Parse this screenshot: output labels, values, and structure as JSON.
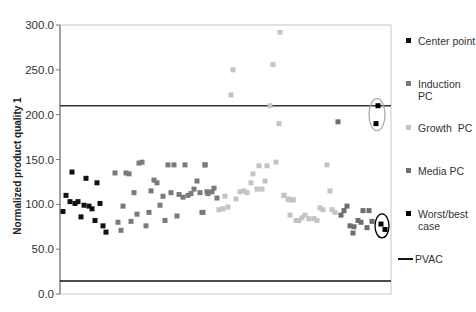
{
  "chart_data": {
    "type": "scatter",
    "title": "",
    "xlabel": "",
    "ylabel": "Normalized product quality 1",
    "ylim": [
      0,
      300
    ],
    "yticks": [
      "0.0",
      "50.0",
      "100.0",
      "150.0",
      "200.0",
      "250.0",
      "300.0"
    ],
    "grid": false,
    "legend_position": "right",
    "reference_lines": [
      {
        "name": "PVAC",
        "y": 210,
        "color": "#333333"
      },
      {
        "name": "PVAC",
        "y": 14.5,
        "color": "#111111"
      }
    ],
    "annotations": [
      {
        "shape": "ellipse",
        "cx": 317,
        "cy": 200,
        "rx": 8,
        "ry": 16,
        "color": "#aaaaaa"
      },
      {
        "shape": "ellipse",
        "cx": 322,
        "cy": 76,
        "rx": 7,
        "ry": 12,
        "color": "#000000"
      }
    ],
    "series": [
      {
        "name": "Center point",
        "color": "#111111",
        "points": [
          [
            3,
            92
          ],
          [
            6,
            110
          ],
          [
            10,
            103
          ],
          [
            12,
            136
          ],
          [
            15,
            101
          ],
          [
            18,
            103
          ],
          [
            21,
            86
          ],
          [
            24,
            99
          ],
          [
            26,
            129
          ],
          [
            29,
            98
          ],
          [
            32,
            95
          ],
          [
            35,
            82
          ],
          [
            37,
            124
          ],
          [
            40,
            101
          ],
          [
            43,
            76
          ],
          [
            46,
            69
          ]
        ]
      },
      {
        "name": "Induction PC",
        "color": "#7a7a7a",
        "points": [
          [
            55,
            135
          ],
          [
            66,
            135
          ],
          [
            69,
            134
          ],
          [
            79,
            146
          ],
          [
            82,
            147
          ],
          [
            108,
            144
          ],
          [
            114,
            144
          ],
          [
            125,
            144
          ],
          [
            145,
            144
          ],
          [
            145,
            144
          ],
          [
            94,
            127
          ],
          [
            97,
            124
          ],
          [
            137,
            126
          ],
          [
            74,
            113
          ],
          [
            91,
            115
          ],
          [
            103,
            109
          ],
          [
            111,
            113
          ],
          [
            119,
            111
          ],
          [
            123,
            108
          ],
          [
            128,
            110
          ],
          [
            131,
            112
          ],
          [
            134,
            117
          ],
          [
            140,
            113
          ],
          [
            147,
            114
          ],
          [
            63,
            98
          ],
          [
            100,
            99
          ],
          [
            77,
            89
          ],
          [
            89,
            91
          ],
          [
            117,
            87
          ],
          [
            143,
            91
          ],
          [
            105,
            82
          ],
          [
            58,
            80
          ],
          [
            71,
            81
          ],
          [
            86,
            76
          ],
          [
            61,
            71
          ],
          [
            148,
            112
          ],
          [
            152,
            114
          ],
          [
            154,
            118
          ],
          [
            157,
            107
          ],
          [
            142,
            91
          ]
        ]
      },
      {
        "name": "Growth PC",
        "color": "#c4c4c4",
        "points": [
          [
            220,
            292
          ],
          [
            173,
            250
          ],
          [
            213,
            256
          ],
          [
            171,
            222
          ],
          [
            210,
            210
          ],
          [
            219,
            190
          ],
          [
            199,
            143
          ],
          [
            207,
            143
          ],
          [
            216,
            147
          ],
          [
            193,
            134
          ],
          [
            191,
            124
          ],
          [
            205,
            126
          ],
          [
            197,
            117
          ],
          [
            202,
            117
          ],
          [
            180,
            114
          ],
          [
            184,
            115
          ],
          [
            187,
            113
          ],
          [
            165,
            109
          ],
          [
            176,
            106
          ],
          [
            224,
            110
          ],
          [
            228,
            106
          ],
          [
            233,
            105
          ],
          [
            159,
            94
          ],
          [
            163,
            95
          ],
          [
            168,
            97
          ],
          [
            267,
            144
          ],
          [
            270,
            115
          ],
          [
            224,
            110
          ],
          [
            229,
            105
          ],
          [
            233,
            105
          ],
          [
            230,
            88
          ],
          [
            236,
            82
          ],
          [
            239,
            82
          ],
          [
            242,
            85
          ],
          [
            245,
            88
          ],
          [
            249,
            84
          ],
          [
            254,
            84
          ],
          [
            257,
            82
          ],
          [
            260,
            96
          ],
          [
            263,
            94
          ],
          [
            272,
            94
          ],
          [
            275,
            91
          ]
        ]
      },
      {
        "name": "Media PC",
        "color": "#6e6e6e",
        "points": [
          [
            278,
            192
          ],
          [
            287,
            98
          ],
          [
            284,
            93
          ],
          [
            281,
            88
          ],
          [
            303,
            93
          ],
          [
            309,
            93
          ],
          [
            298,
            82
          ],
          [
            301,
            80
          ],
          [
            312,
            81
          ],
          [
            290,
            76
          ],
          [
            294,
            75
          ],
          [
            307,
            74
          ],
          [
            293,
            68
          ]
        ]
      },
      {
        "name": "Worst/best case",
        "color": "#000000",
        "points": [
          [
            318,
            210
          ],
          [
            316,
            190
          ],
          [
            321,
            78
          ],
          [
            325,
            72
          ]
        ]
      }
    ]
  },
  "legend": {
    "items": [
      {
        "label": "Center point",
        "color": "#111111"
      },
      {
        "label": "Induction PC",
        "color": "#7a7a7a"
      },
      {
        "label": "Growth  PC",
        "color": "#c4c4c4"
      },
      {
        "label": "Media PC",
        "color": "#6e6e6e"
      },
      {
        "label": "Worst/best case",
        "color": "#000000"
      },
      {
        "label": "PVAC",
        "color": "#111111"
      }
    ]
  }
}
